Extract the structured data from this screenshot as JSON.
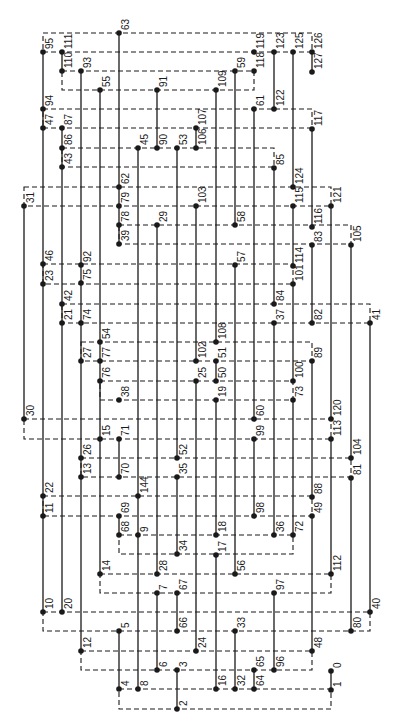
{
  "diagram": {
    "type": "node-graph",
    "colors": {
      "ink": "#1a1a1a",
      "background": "#ffffff"
    },
    "nodes": [
      {
        "label": "63",
        "x": 119,
        "y": 33
      },
      {
        "label": "95",
        "x": 43,
        "y": 52
      },
      {
        "label": "111",
        "x": 62,
        "y": 52
      },
      {
        "label": "119",
        "x": 254,
        "y": 52
      },
      {
        "label": "123",
        "x": 274,
        "y": 52
      },
      {
        "label": "125",
        "x": 293,
        "y": 52
      },
      {
        "label": "126",
        "x": 312,
        "y": 52
      },
      {
        "label": "110",
        "x": 62,
        "y": 71
      },
      {
        "label": "93",
        "x": 81,
        "y": 71
      },
      {
        "label": "59",
        "x": 235,
        "y": 71
      },
      {
        "label": "118",
        "x": 254,
        "y": 71
      },
      {
        "label": "127",
        "x": 312,
        "y": 72
      },
      {
        "label": "55",
        "x": 100,
        "y": 90
      },
      {
        "label": "91",
        "x": 157,
        "y": 90
      },
      {
        "label": "109",
        "x": 216,
        "y": 90
      },
      {
        "label": "94",
        "x": 43,
        "y": 109
      },
      {
        "label": "61",
        "x": 254,
        "y": 109
      },
      {
        "label": "122",
        "x": 274,
        "y": 109
      },
      {
        "label": "47",
        "x": 43,
        "y": 128
      },
      {
        "label": "87",
        "x": 62,
        "y": 128
      },
      {
        "label": "107",
        "x": 196,
        "y": 128
      },
      {
        "label": "117",
        "x": 312,
        "y": 129
      },
      {
        "label": "86",
        "x": 62,
        "y": 148
      },
      {
        "label": "45",
        "x": 138,
        "y": 148
      },
      {
        "label": "90",
        "x": 157,
        "y": 148
      },
      {
        "label": "53",
        "x": 177,
        "y": 148
      },
      {
        "label": "106",
        "x": 196,
        "y": 148
      },
      {
        "label": "43",
        "x": 62,
        "y": 167
      },
      {
        "label": "85",
        "x": 274,
        "y": 168
      },
      {
        "label": "62",
        "x": 119,
        "y": 187
      },
      {
        "label": "124",
        "x": 293,
        "y": 187
      },
      {
        "label": "31",
        "x": 24,
        "y": 206
      },
      {
        "label": "79",
        "x": 119,
        "y": 206
      },
      {
        "label": "103",
        "x": 196,
        "y": 206
      },
      {
        "label": "115",
        "x": 293,
        "y": 206
      },
      {
        "label": "121",
        "x": 331,
        "y": 206
      },
      {
        "label": "78",
        "x": 119,
        "y": 225
      },
      {
        "label": "29",
        "x": 157,
        "y": 225
      },
      {
        "label": "58",
        "x": 235,
        "y": 225
      },
      {
        "label": "116",
        "x": 312,
        "y": 227
      },
      {
        "label": "39",
        "x": 119,
        "y": 244
      },
      {
        "label": "83",
        "x": 312,
        "y": 245
      },
      {
        "label": "105",
        "x": 351,
        "y": 245
      },
      {
        "label": "46",
        "x": 43,
        "y": 264
      },
      {
        "label": "92",
        "x": 81,
        "y": 265
      },
      {
        "label": "57",
        "x": 235,
        "y": 265
      },
      {
        "label": "114",
        "x": 293,
        "y": 266
      },
      {
        "label": "23",
        "x": 43,
        "y": 284
      },
      {
        "label": "75",
        "x": 81,
        "y": 283
      },
      {
        "label": "101",
        "x": 293,
        "y": 284
      },
      {
        "label": "42",
        "x": 62,
        "y": 304
      },
      {
        "label": "84",
        "x": 274,
        "y": 304
      },
      {
        "label": "21",
        "x": 62,
        "y": 323
      },
      {
        "label": "74",
        "x": 81,
        "y": 323
      },
      {
        "label": "37",
        "x": 274,
        "y": 323
      },
      {
        "label": "82",
        "x": 312,
        "y": 323
      },
      {
        "label": "41",
        "x": 370,
        "y": 323
      },
      {
        "label": "54",
        "x": 100,
        "y": 342
      },
      {
        "label": "108",
        "x": 216,
        "y": 342
      },
      {
        "label": "27",
        "x": 81,
        "y": 361
      },
      {
        "label": "77",
        "x": 100,
        "y": 361
      },
      {
        "label": "102",
        "x": 196,
        "y": 361
      },
      {
        "label": "51",
        "x": 216,
        "y": 361
      },
      {
        "label": "89",
        "x": 312,
        "y": 361
      },
      {
        "label": "76",
        "x": 100,
        "y": 381
      },
      {
        "label": "25",
        "x": 196,
        "y": 381
      },
      {
        "label": "50",
        "x": 216,
        "y": 381
      },
      {
        "label": "100",
        "x": 293,
        "y": 381
      },
      {
        "label": "38",
        "x": 119,
        "y": 400
      },
      {
        "label": "19",
        "x": 216,
        "y": 400
      },
      {
        "label": "73",
        "x": 293,
        "y": 400
      },
      {
        "label": "30",
        "x": 24,
        "y": 419
      },
      {
        "label": "60",
        "x": 254,
        "y": 419
      },
      {
        "label": "120",
        "x": 331,
        "y": 419
      },
      {
        "label": "15",
        "x": 100,
        "y": 439
      },
      {
        "label": "71",
        "x": 119,
        "y": 439
      },
      {
        "label": "99",
        "x": 254,
        "y": 439
      },
      {
        "label": "113",
        "x": 331,
        "y": 439
      },
      {
        "label": "26",
        "x": 81,
        "y": 458
      },
      {
        "label": "52",
        "x": 177,
        "y": 458
      },
      {
        "label": "104",
        "x": 351,
        "y": 458
      },
      {
        "label": "13",
        "x": 81,
        "y": 477
      },
      {
        "label": "70",
        "x": 119,
        "y": 477
      },
      {
        "label": "35",
        "x": 177,
        "y": 477
      },
      {
        "label": "81",
        "x": 351,
        "y": 478
      },
      {
        "label": "22",
        "x": 43,
        "y": 496
      },
      {
        "label": "144",
        "x": 138,
        "y": 496
      },
      {
        "label": "88",
        "x": 312,
        "y": 497
      },
      {
        "label": "11",
        "x": 43,
        "y": 516
      },
      {
        "label": "69",
        "x": 119,
        "y": 516
      },
      {
        "label": "98",
        "x": 254,
        "y": 516
      },
      {
        "label": "49",
        "x": 312,
        "y": 516
      },
      {
        "label": "68",
        "x": 119,
        "y": 535
      },
      {
        "label": "9",
        "x": 138,
        "y": 535
      },
      {
        "label": "18",
        "x": 216,
        "y": 535
      },
      {
        "label": "36",
        "x": 274,
        "y": 535
      },
      {
        "label": "72",
        "x": 293,
        "y": 535
      },
      {
        "label": "34",
        "x": 177,
        "y": 554
      },
      {
        "label": "17",
        "x": 216,
        "y": 555
      },
      {
        "label": "14",
        "x": 100,
        "y": 574
      },
      {
        "label": "28",
        "x": 157,
        "y": 574
      },
      {
        "label": "56",
        "x": 235,
        "y": 574
      },
      {
        "label": "112",
        "x": 331,
        "y": 574
      },
      {
        "label": "7",
        "x": 157,
        "y": 593
      },
      {
        "label": "67",
        "x": 177,
        "y": 593
      },
      {
        "label": "97",
        "x": 274,
        "y": 593
      },
      {
        "label": "10",
        "x": 43,
        "y": 612
      },
      {
        "label": "20",
        "x": 62,
        "y": 612
      },
      {
        "label": "40",
        "x": 370,
        "y": 612
      },
      {
        "label": "5",
        "x": 119,
        "y": 631
      },
      {
        "label": "66",
        "x": 177,
        "y": 631
      },
      {
        "label": "33",
        "x": 235,
        "y": 631
      },
      {
        "label": "80",
        "x": 351,
        "y": 631
      },
      {
        "label": "12",
        "x": 81,
        "y": 651
      },
      {
        "label": "24",
        "x": 196,
        "y": 651
      },
      {
        "label": "48",
        "x": 312,
        "y": 651
      },
      {
        "label": "6",
        "x": 157,
        "y": 670
      },
      {
        "label": "3",
        "x": 177,
        "y": 670
      },
      {
        "label": "65",
        "x": 254,
        "y": 670
      },
      {
        "label": "96",
        "x": 274,
        "y": 670
      },
      {
        "label": "0",
        "x": 331,
        "y": 671
      },
      {
        "label": "4",
        "x": 119,
        "y": 689
      },
      {
        "label": "8",
        "x": 138,
        "y": 689
      },
      {
        "label": "16",
        "x": 216,
        "y": 689
      },
      {
        "label": "32",
        "x": 235,
        "y": 689
      },
      {
        "label": "64",
        "x": 254,
        "y": 689
      },
      {
        "label": "1",
        "x": 331,
        "y": 690
      },
      {
        "label": "2",
        "x": 177,
        "y": 709
      }
    ],
    "solid_lines": [
      [
        24,
        206,
        24,
        419
      ],
      [
        43,
        52,
        43,
        612
      ],
      [
        62,
        52,
        62,
        71
      ],
      [
        62,
        128,
        62,
        612
      ],
      [
        81,
        71,
        81,
        651
      ],
      [
        100,
        90,
        100,
        574
      ],
      [
        119,
        33,
        119,
        244
      ],
      [
        119,
        439,
        119,
        477
      ],
      [
        119,
        516,
        119,
        535
      ],
      [
        119,
        631,
        119,
        689
      ],
      [
        138,
        148,
        138,
        689
      ],
      [
        157,
        90,
        157,
        148
      ],
      [
        157,
        225,
        157,
        574
      ],
      [
        157,
        593,
        157,
        670
      ],
      [
        177,
        148,
        177,
        458
      ],
      [
        177,
        477,
        177,
        554
      ],
      [
        177,
        593,
        177,
        631
      ],
      [
        177,
        670,
        177,
        709
      ],
      [
        196,
        128,
        196,
        148
      ],
      [
        196,
        206,
        196,
        361
      ],
      [
        196,
        381,
        196,
        651
      ],
      [
        216,
        90,
        216,
        342
      ],
      [
        216,
        361,
        216,
        381
      ],
      [
        216,
        400,
        216,
        535
      ],
      [
        216,
        555,
        216,
        689
      ],
      [
        235,
        71,
        235,
        225
      ],
      [
        235,
        265,
        235,
        574
      ],
      [
        235,
        631,
        235,
        689
      ],
      [
        254,
        109,
        254,
        419
      ],
      [
        254,
        439,
        254,
        516
      ],
      [
        254,
        670,
        254,
        689
      ],
      [
        274,
        52,
        274,
        109
      ],
      [
        274,
        168,
        274,
        304
      ],
      [
        274,
        323,
        274,
        535
      ],
      [
        274,
        593,
        274,
        670
      ],
      [
        293,
        52,
        293,
        187
      ],
      [
        293,
        206,
        293,
        266
      ],
      [
        293,
        284,
        293,
        381
      ],
      [
        293,
        400,
        293,
        535
      ],
      [
        312,
        52,
        312,
        72
      ],
      [
        312,
        129,
        312,
        227
      ],
      [
        312,
        245,
        312,
        323
      ],
      [
        312,
        361,
        312,
        497
      ],
      [
        312,
        516,
        312,
        651
      ],
      [
        331,
        206,
        331,
        419
      ],
      [
        331,
        439,
        331,
        574
      ],
      [
        331,
        671,
        331,
        690
      ],
      [
        351,
        245,
        351,
        458
      ],
      [
        351,
        478,
        351,
        631
      ],
      [
        370,
        323,
        370,
        612
      ]
    ],
    "dashed_boxes": [
      [
        43,
        33,
        312,
        52
      ],
      [
        62,
        71,
        254,
        90
      ],
      [
        43,
        109,
        312,
        128
      ],
      [
        62,
        148,
        274,
        167
      ],
      [
        24,
        187,
        331,
        206
      ],
      [
        119,
        225,
        351,
        244
      ],
      [
        43,
        264,
        293,
        284
      ],
      [
        62,
        304,
        370,
        323
      ],
      [
        81,
        342,
        312,
        361
      ],
      [
        100,
        381,
        293,
        400
      ],
      [
        24,
        419,
        331,
        439
      ],
      [
        81,
        458,
        351,
        477
      ],
      [
        43,
        496,
        312,
        516
      ],
      [
        119,
        535,
        293,
        554
      ],
      [
        100,
        574,
        331,
        593
      ],
      [
        43,
        612,
        370,
        631
      ],
      [
        81,
        651,
        312,
        670
      ],
      [
        119,
        689,
        331,
        709
      ]
    ]
  }
}
